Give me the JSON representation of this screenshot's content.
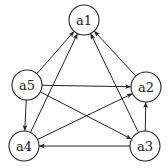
{
  "diagram": {
    "type": "directed-graph",
    "nodes": [
      {
        "id": "a1",
        "label": "a1"
      },
      {
        "id": "a2",
        "label": "a2"
      },
      {
        "id": "a3",
        "label": "a3"
      },
      {
        "id": "a4",
        "label": "a4"
      },
      {
        "id": "a5",
        "label": "a5"
      }
    ],
    "edges": [
      {
        "from": "a5",
        "to": "a1"
      },
      {
        "from": "a4",
        "to": "a1"
      },
      {
        "from": "a3",
        "to": "a1"
      },
      {
        "from": "a2",
        "to": "a1"
      },
      {
        "from": "a5",
        "to": "a2"
      },
      {
        "from": "a5",
        "to": "a3"
      },
      {
        "from": "a5",
        "to": "a4"
      },
      {
        "from": "a4",
        "to": "a2"
      },
      {
        "from": "a3",
        "to": "a4"
      },
      {
        "from": "a3",
        "to": "a2"
      }
    ]
  }
}
